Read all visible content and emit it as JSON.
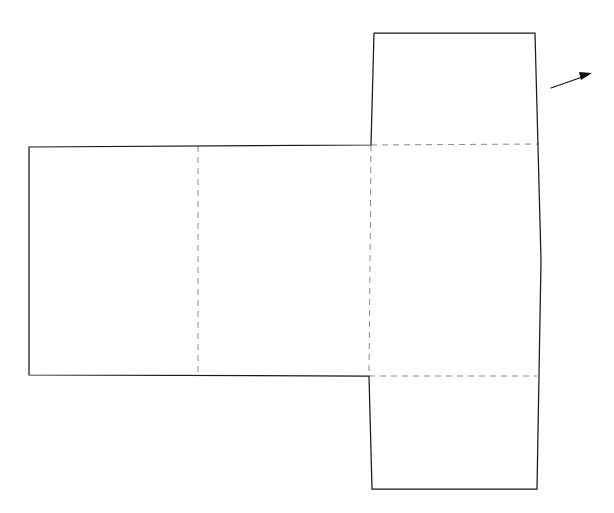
{
  "diagram": {
    "canvas": {
      "width": 614,
      "height": 513,
      "background": "#ffffff"
    },
    "colors": {
      "cut_line": "#1a1a1a",
      "fold_line": "#8a8a8a",
      "arrow": "#111111",
      "face_fill": "#ffffff"
    },
    "line_styles": {
      "cut": "solid",
      "fold": "dashed"
    },
    "outline_path": "M 29,147 L 371,145 L 374,33 L 535,33 L 541,260 L 537,489 L 372,489 L 369,376 L 29,375 Z",
    "panels": [
      {
        "name": "left-panel",
        "path": "M 29,147 L 198,146 L 198,375 L 29,375 Z"
      },
      {
        "name": "middle-panel",
        "path": "M 198,146 L 371,145 L 369,376 L 198,375 Z"
      },
      {
        "name": "right-panel",
        "path": "M 371,145 L 539,144 L 537,376 L 369,376 Z"
      },
      {
        "name": "top-flap-panel",
        "path": "M 374,33 L 535,33 L 539,144 L 371,145 Z"
      },
      {
        "name": "bottom-flap-panel",
        "path": "M 369,376 L 537,376 L 537,489 L 372,489 Z"
      }
    ],
    "fold_lines": [
      {
        "name": "fold-vertical-left",
        "x1": 198,
        "y1": 146,
        "x2": 198,
        "y2": 375
      },
      {
        "name": "fold-vertical-right",
        "x1": 371,
        "y1": 145,
        "x2": 369,
        "y2": 376
      },
      {
        "name": "fold-horizontal-top",
        "x1": 371,
        "y1": 145,
        "x2": 539,
        "y2": 144
      },
      {
        "name": "fold-horizontal-bottom",
        "x1": 369,
        "y1": 376,
        "x2": 537,
        "y2": 376
      }
    ],
    "annotation_arrow": {
      "name": "pointer-arrow",
      "shaft_x1": 551,
      "shaft_y1": 88,
      "shaft_x2": 588,
      "shaft_y2": 75,
      "head_points": "592,73 579,72 581,80",
      "direction": "right-and-up",
      "points_to": "right-panel"
    }
  }
}
